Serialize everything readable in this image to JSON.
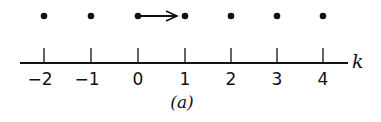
{
  "diagram": {
    "axis_label": "k",
    "caption": "(a)",
    "ticks": [
      {
        "value": "−2",
        "x": 44
      },
      {
        "value": "−1",
        "x": 91
      },
      {
        "value": "0",
        "x": 138
      },
      {
        "value": "1",
        "x": 185
      },
      {
        "value": "2",
        "x": 231
      },
      {
        "value": "3",
        "x": 277
      },
      {
        "value": "4",
        "x": 323
      }
    ],
    "points": [
      -2,
      -1,
      0,
      1,
      2,
      3,
      4
    ],
    "arrow": {
      "from": 0,
      "to": 1
    },
    "colors": {
      "ink": "#111111",
      "background": "#ffffff"
    }
  }
}
